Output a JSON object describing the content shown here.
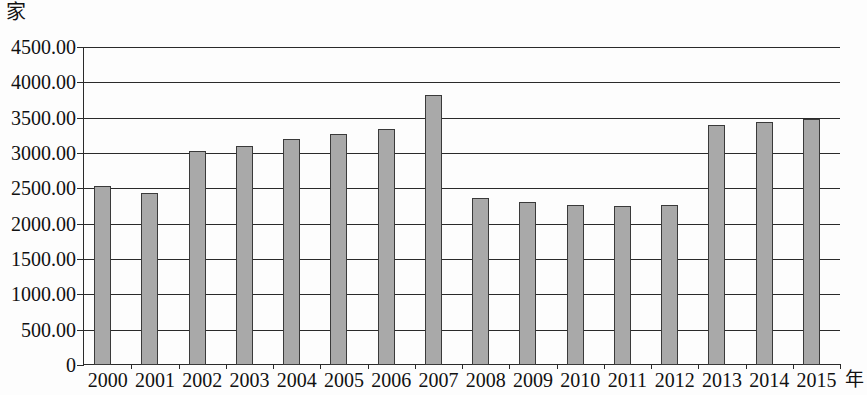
{
  "chart_data": {
    "type": "bar",
    "title": "",
    "xlabel": "年",
    "ylabel": "家",
    "ylim": [
      0,
      4500
    ],
    "ytick_labels": [
      "0",
      "500.00",
      "1000.00",
      "1500.00",
      "2000.00",
      "2500.00",
      "3000.00",
      "3500.00",
      "4000.00",
      "4500.00"
    ],
    "ytick_values": [
      0,
      500,
      1000,
      1500,
      2000,
      2500,
      3000,
      3500,
      4000,
      4500
    ],
    "grid": true,
    "legend": false,
    "categories": [
      "2000",
      "2001",
      "2002",
      "2003",
      "2004",
      "2005",
      "2006",
      "2007",
      "2008",
      "2009",
      "2010",
      "2011",
      "2012",
      "2013",
      "2014",
      "2015"
    ],
    "values": [
      2540,
      2440,
      3030,
      3100,
      3200,
      3270,
      3340,
      3820,
      2370,
      2300,
      2270,
      2250,
      2270,
      3390,
      3440,
      3480
    ],
    "bar_color": "#a9a9a9",
    "bar_edge_color": "#3a3a3a",
    "axis_color": "#2a2a2a",
    "background_color": "#fdfdfd"
  }
}
